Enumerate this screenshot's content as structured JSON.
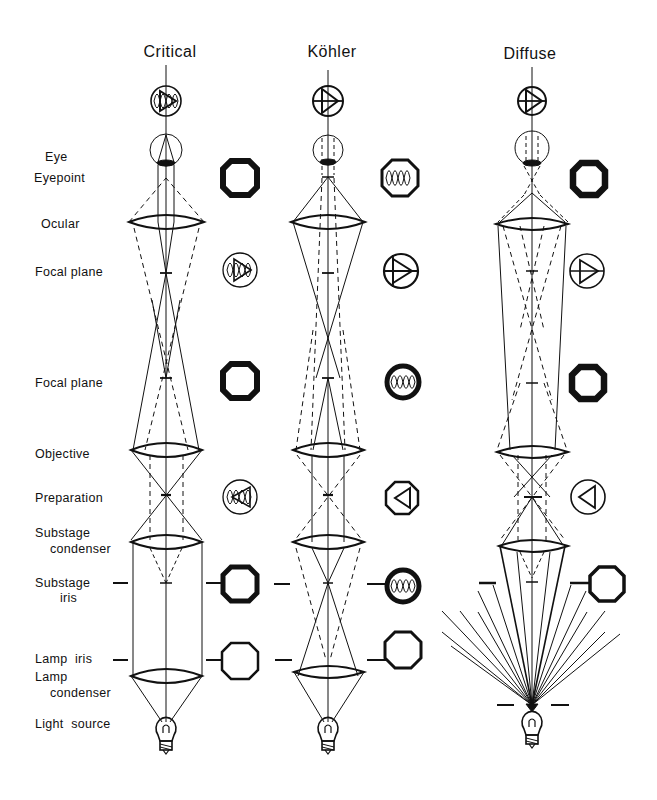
{
  "columns": [
    {
      "id": "critical",
      "title": "Critical",
      "x": 166,
      "title_x": 170,
      "title_y": 45
    },
    {
      "id": "kohler",
      "title": "Köhler",
      "x": 328,
      "title_x": 332,
      "title_y": 45
    },
    {
      "id": "diffuse",
      "title": "Diffuse",
      "x": 532,
      "title_x": 530,
      "title_y": 47
    }
  ],
  "row_labels": [
    {
      "id": "eye",
      "text": "Eye",
      "x": 45,
      "y": 150
    },
    {
      "id": "eyepoint",
      "text": "Eyepoint",
      "x": 34,
      "y": 172
    },
    {
      "id": "ocular",
      "text": "Ocular",
      "x": 41,
      "y": 216
    },
    {
      "id": "focal-plane-1",
      "text": "Focal plane",
      "x": 35,
      "y": 264
    },
    {
      "id": "focal-plane-2",
      "text": "Focal plane",
      "x": 35,
      "y": 376
    },
    {
      "id": "objective",
      "text": "Objective",
      "x": 35,
      "y": 446
    },
    {
      "id": "preparation",
      "text": "Preparation",
      "x": 35,
      "y": 491
    },
    {
      "id": "substage",
      "text": "Substage",
      "x": 35,
      "y": 527
    },
    {
      "id": "substage-condenser",
      "text": "condenser",
      "x": 50,
      "y": 543
    },
    {
      "id": "substage-iris-1",
      "text": "Substage",
      "x": 35,
      "y": 575
    },
    {
      "id": "substage-iris-2",
      "text": "iris",
      "x": 60,
      "y": 591
    },
    {
      "id": "lamp-iris",
      "text": "Lamp  iris",
      "x": 35,
      "y": 651
    },
    {
      "id": "lamp",
      "text": "Lamp",
      "x": 35,
      "y": 671
    },
    {
      "id": "lamp-condenser",
      "text": "condenser",
      "x": 50,
      "y": 687
    },
    {
      "id": "light-source",
      "text": "Light  source",
      "x": 35,
      "y": 717
    }
  ],
  "legend_symbols": {
    "critical": [
      "image-overlay-in-circle",
      "thick-ring",
      "image-overlay-in-circle",
      "thick-ring",
      "image-overlay-in-circle",
      "thick-ring",
      "thin-octagon-ring"
    ],
    "kohler": [
      "filament-in-ring",
      "crosshair-triangle",
      "filament-in-ring",
      "triangle-left-ring",
      "filament-in-ring",
      "thin-octagon-ring"
    ],
    "diffuse": [
      "thick-ring",
      "crosshair-triangle",
      "thick-ring",
      "triangle-left-ring",
      "thin-octagon-ring"
    ]
  },
  "colors": {
    "ink": "#111111",
    "background": "#ffffff"
  }
}
